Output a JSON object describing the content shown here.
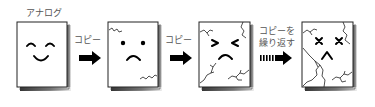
{
  "diagram": {
    "title_label": "アナログ",
    "copy_label_1": "コピー",
    "copy_label_2": "コピー",
    "repeat_label_line1": "コピーを",
    "repeat_label_line2": "繰り返す",
    "stages": [
      {
        "name": "original",
        "face": "happy",
        "cracks": 0
      },
      {
        "name": "copy-1",
        "face": "sad",
        "cracks": 2
      },
      {
        "name": "copy-2",
        "face": "pained",
        "cracks": 5
      },
      {
        "name": "copy-repeated",
        "face": "broken",
        "cracks": 8
      }
    ],
    "colors": {
      "ink": "#000000",
      "label": "#555555",
      "paper": "#ffffff",
      "shadow": "#7a7a7a"
    }
  }
}
